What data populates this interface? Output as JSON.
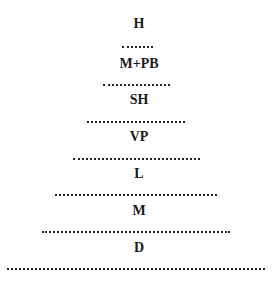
{
  "diagram": {
    "levels": [
      {
        "label": "H"
      },
      {
        "label": "M+PB"
      },
      {
        "label": "SH"
      },
      {
        "label": "VP"
      },
      {
        "label": "L"
      },
      {
        "label": "M"
      },
      {
        "label": "D"
      }
    ],
    "separator_style": "dotted",
    "colors": {
      "text": "#1a1a1a",
      "background": "#ffffff"
    }
  }
}
